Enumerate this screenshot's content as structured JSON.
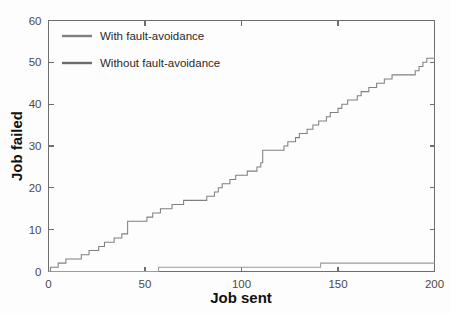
{
  "chart_data": {
    "type": "line",
    "title": "",
    "xlabel": "Job sent",
    "ylabel": "Job failed",
    "xlim": [
      0,
      200
    ],
    "ylim": [
      0,
      60
    ],
    "xticks": [
      0,
      50,
      100,
      150,
      200
    ],
    "yticks": [
      0,
      10,
      20,
      30,
      40,
      50,
      60
    ],
    "grid": false,
    "legend_position": "upper-left-inside",
    "line_style": "step-post",
    "series": [
      {
        "name": "With fault-avoidance",
        "color": "#808080",
        "x": [
          0,
          1,
          3,
          5,
          7,
          9,
          11,
          13,
          15,
          17,
          21,
          24,
          26,
          29,
          32,
          34,
          36,
          38,
          40,
          41,
          50,
          51,
          54,
          56,
          58,
          62,
          64,
          67,
          70,
          74,
          80,
          82,
          84,
          86,
          88,
          90,
          92,
          94,
          97,
          100,
          103,
          106,
          108,
          110,
          111,
          121,
          122,
          124,
          126,
          128,
          130,
          132,
          134,
          137,
          140,
          142,
          144,
          146,
          148,
          150,
          152,
          155,
          157,
          160,
          162,
          164,
          166,
          168,
          170,
          172,
          174,
          176,
          178,
          188,
          190,
          192,
          194,
          196,
          198,
          200
        ],
        "y": [
          0,
          1,
          1,
          2,
          2,
          3,
          3,
          3,
          3,
          4,
          5,
          5,
          6,
          7,
          7,
          8,
          8,
          9,
          9,
          12,
          12,
          13,
          14,
          14,
          15,
          15,
          16,
          16,
          17,
          17,
          17,
          18,
          18,
          19,
          20,
          21,
          21,
          22,
          23,
          23,
          24,
          24,
          25,
          26,
          29,
          29,
          30,
          31,
          31,
          32,
          33,
          33,
          34,
          35,
          36,
          36,
          37,
          38,
          38,
          39,
          40,
          41,
          41,
          42,
          43,
          43,
          44,
          44,
          45,
          45,
          46,
          46,
          47,
          47,
          48,
          49,
          50,
          51,
          51,
          52
        ]
      },
      {
        "name": "Without fault-avoidance",
        "color": "#9a9a9a",
        "x": [
          0,
          57,
          57,
          141,
          141,
          200
        ],
        "y": [
          0,
          0,
          1,
          1,
          2,
          2
        ]
      }
    ]
  },
  "legend": {
    "items": [
      {
        "label": "With fault-avoidance",
        "color": "#808080"
      },
      {
        "label": "Without fault-avoidance",
        "color": "#6b6b6b"
      }
    ]
  },
  "axes": {
    "x_tick_labels": [
      "0",
      "50",
      "100",
      "150",
      "200"
    ],
    "y_tick_labels": [
      "0",
      "10",
      "20",
      "30",
      "40",
      "50",
      "60"
    ],
    "x_title": "Job sent",
    "y_title": "Job failed"
  },
  "colors": {
    "axis": "#6e6e6e",
    "text": "#111111",
    "tick_text": "#4a4a4a",
    "background": "#fdfdfd"
  }
}
